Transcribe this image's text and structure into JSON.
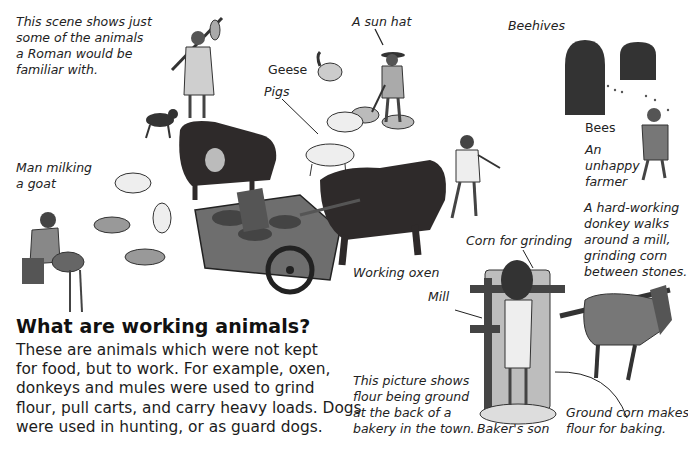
{
  "labels": {
    "intro": [
      "This scene shows just",
      "some of the animals",
      "a Roman would be",
      "familiar with."
    ],
    "sun_hat": "A sun hat",
    "beehives": "Beehives",
    "geese": "Geese",
    "pigs": "Pigs",
    "bees": "Bees",
    "unhappy_farmer": [
      "An",
      "unhappy",
      "farmer"
    ],
    "man_milking": [
      "Man milking",
      "a goat"
    ],
    "donkey_note": [
      "A hard-working",
      "donkey walks",
      "around a mill,",
      "grinding corn",
      "between stones."
    ],
    "corn_for_grinding": "Corn for grinding",
    "working_oxen": "Working oxen",
    "mill": "Mill",
    "picture_note": [
      "This picture shows",
      "flour being ground",
      "at the back of a",
      "bakery in the town."
    ],
    "bakers_son": "Baker's son",
    "ground_corn": [
      "Ground corn makes",
      "flour for baking."
    ]
  },
  "section": {
    "heading": "What are working animals?",
    "body": [
      "These are animals which were not kept",
      "for food, but to work. For example, oxen,",
      "donkeys and mules were used to grind",
      "flour, pull carts, and carry heavy loads. Dogs",
      "were used in hunting, or as guard dogs."
    ]
  },
  "colors": {
    "ink": "#1c1c1c",
    "dark_animal": "#2e2a2a",
    "grey": "#8a8a8a",
    "light": "#d8d8d8"
  }
}
